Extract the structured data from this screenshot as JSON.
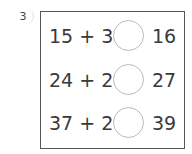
{
  "problem_number": "3",
  "rows": [
    {
      "left": "15 + 3",
      "right": "16",
      "answer": ""
    },
    {
      "left": "24 + 2",
      "right": "27",
      "answer": ""
    },
    {
      "left": "37 + 2",
      "right": "39",
      "answer": ""
    }
  ]
}
